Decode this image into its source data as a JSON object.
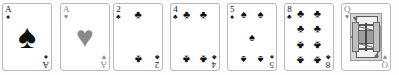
{
  "scene": {
    "title": "Playing card hand",
    "background_color": "#fdfdfd",
    "card_face_color": "#ffffff",
    "card_border_color": "#b9b9b9",
    "black_suit_color": "#101010",
    "red_suit_rendered_color": "#8a8a8a",
    "card_count": 7,
    "card_width_px": 50,
    "card_height_px": 68
  },
  "suits": {
    "spade_glyph": "♠",
    "heart_glyph": "♥",
    "club_glyph": "♣",
    "diamond_glyph": "♦"
  },
  "cards": [
    {
      "id": "ace-of-spades",
      "rank": "A",
      "suit": "spades",
      "suit_glyph": "♠",
      "color": "#101010",
      "x": 2,
      "layout": "ace",
      "pip_count": 1
    },
    {
      "id": "ace-of-hearts",
      "rank": "A",
      "suit": "hearts",
      "suit_glyph": "♥",
      "color": "#8a8a8a",
      "x": 60,
      "layout": "ace",
      "pip_count": 1
    },
    {
      "id": "two-of-clubs",
      "rank": "2",
      "suit": "clubs",
      "suit_glyph": "♣",
      "color": "#101010",
      "x": 113,
      "layout": "pips",
      "pip_count": 2
    },
    {
      "id": "four-of-clubs",
      "rank": "4",
      "suit": "clubs",
      "suit_glyph": "♣",
      "color": "#101010",
      "x": 170,
      "layout": "pips",
      "pip_count": 4
    },
    {
      "id": "five-of-spades",
      "rank": "5",
      "suit": "spades",
      "suit_glyph": "♠",
      "color": "#101010",
      "x": 227,
      "layout": "pips",
      "pip_count": 5
    },
    {
      "id": "eight-of-clubs",
      "rank": "8",
      "suit": "clubs",
      "suit_glyph": "♣",
      "color": "#101010",
      "x": 284,
      "layout": "pips",
      "pip_count": 8
    },
    {
      "id": "queen-of-hearts",
      "rank": "Q",
      "suit": "hearts",
      "suit_glyph": "♥",
      "color": "#8a8a8a",
      "x": 341,
      "layout": "court",
      "pip_count": 0
    }
  ],
  "pip_positions": {
    "2": [
      [
        50,
        12
      ],
      [
        50,
        88
      ]
    ],
    "4": [
      [
        22,
        12
      ],
      [
        78,
        12
      ],
      [
        22,
        88
      ],
      [
        78,
        88
      ]
    ],
    "5": [
      [
        22,
        12
      ],
      [
        78,
        12
      ],
      [
        50,
        50
      ],
      [
        22,
        88
      ],
      [
        78,
        88
      ]
    ],
    "8": [
      [
        22,
        10
      ],
      [
        78,
        10
      ],
      [
        22,
        36
      ],
      [
        78,
        36
      ],
      [
        22,
        64
      ],
      [
        78,
        64
      ],
      [
        22,
        90
      ],
      [
        78,
        90
      ]
    ]
  },
  "flip_rule": "pips below vertical midpoint are rotated 180 degrees"
}
